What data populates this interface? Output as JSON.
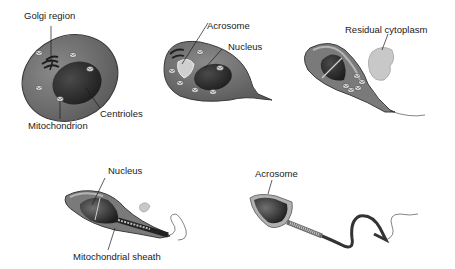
{
  "diagram": {
    "type": "spermiogenesis-stages",
    "stages": [
      {
        "id": "stage-1",
        "labels": {
          "golgi": "Golgi region",
          "centrioles": "Centrioles",
          "mitochondrion": "Mitochondrion"
        }
      },
      {
        "id": "stage-2",
        "labels": {
          "acrosome": "Acrosome",
          "nucleus": "Nucleus"
        }
      },
      {
        "id": "stage-3",
        "labels": {
          "residual": "Residual cytoplasm"
        }
      },
      {
        "id": "stage-4",
        "labels": {
          "nucleus": "Nucleus",
          "sheath": "Mitochondrial sheath"
        }
      },
      {
        "id": "stage-5",
        "labels": {
          "acrosome": "Acrosome"
        }
      }
    ],
    "colors": {
      "cytoplasm": "#6e6e6e",
      "cytoplasm_light": "#9a9a9a",
      "nucleus": "#2e2e2e",
      "outline": "#3a3a3a",
      "residual": "#c8c8c8",
      "text": "#1a1a1a"
    }
  }
}
